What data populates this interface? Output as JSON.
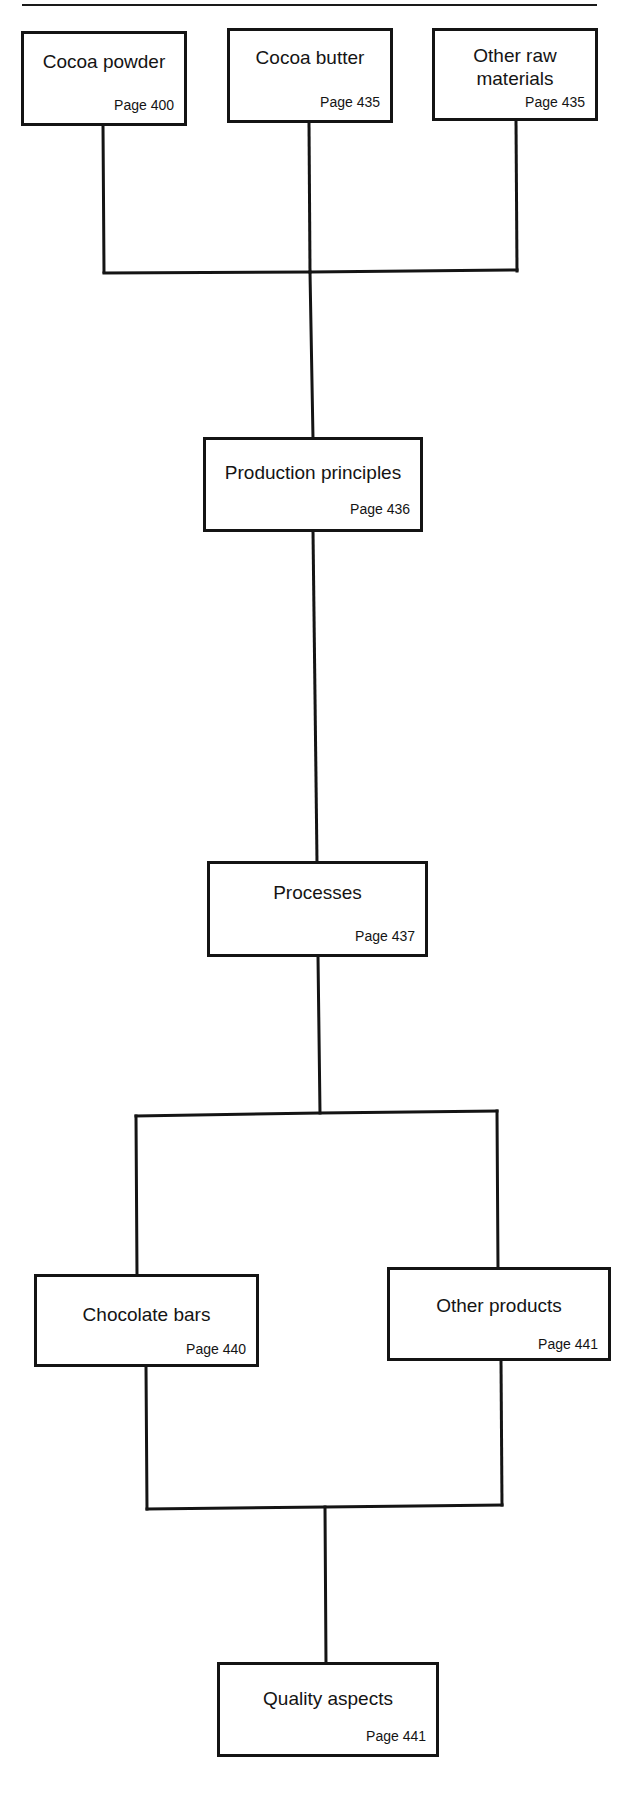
{
  "diagram": {
    "type": "flowchart",
    "nodes": [
      {
        "id": "cocoa_powder",
        "title": "Cocoa powder",
        "page": "Page 400"
      },
      {
        "id": "cocoa_butter",
        "title": "Cocoa butter",
        "page": "Page 435"
      },
      {
        "id": "other_raw",
        "title": "Other raw materials",
        "title_lines": [
          "Other raw",
          "materials"
        ],
        "page": "Page 435"
      },
      {
        "id": "production_principles",
        "title": "Production principles",
        "page": "Page 436"
      },
      {
        "id": "processes",
        "title": "Processes",
        "page": "Page 437"
      },
      {
        "id": "chocolate_bars",
        "title": "Chocolate bars",
        "page": "Page 440"
      },
      {
        "id": "other_products",
        "title": "Other products",
        "page": "Page 441"
      },
      {
        "id": "quality_aspects",
        "title": "Quality aspects",
        "page": "Page 441"
      }
    ],
    "edges": [
      {
        "from": "cocoa_powder",
        "to": "production_principles"
      },
      {
        "from": "cocoa_butter",
        "to": "production_principles"
      },
      {
        "from": "other_raw",
        "to": "production_principles"
      },
      {
        "from": "production_principles",
        "to": "processes"
      },
      {
        "from": "processes",
        "to": "chocolate_bars"
      },
      {
        "from": "processes",
        "to": "other_products"
      },
      {
        "from": "chocolate_bars",
        "to": "quality_aspects"
      },
      {
        "from": "other_products",
        "to": "quality_aspects"
      }
    ]
  },
  "colors": {
    "line": "#141414",
    "background": "#ffffff"
  }
}
